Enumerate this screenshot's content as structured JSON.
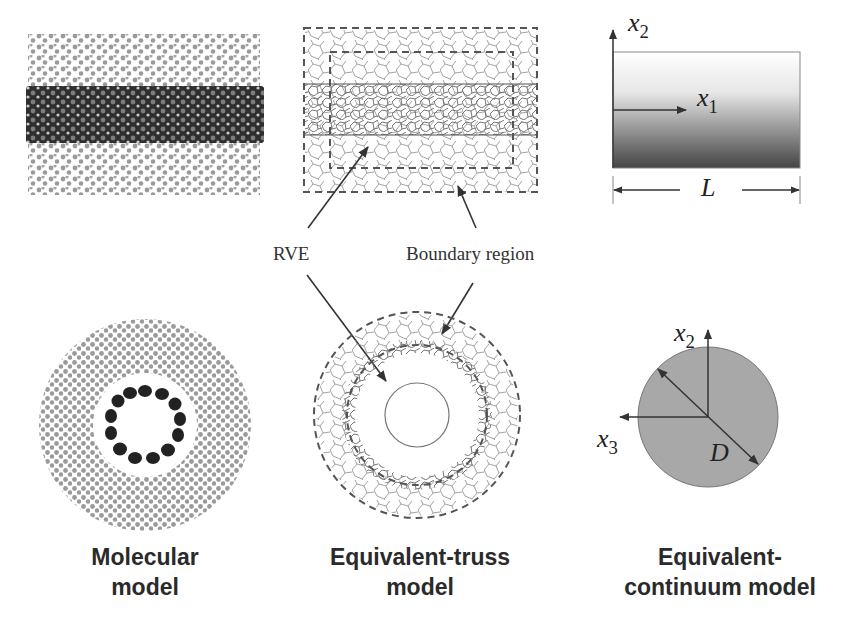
{
  "figure": {
    "panels": [
      {
        "id": "molecular",
        "caption_line1": "Molecular",
        "caption_line2": "model"
      },
      {
        "id": "truss",
        "caption_line1": "Equivalent-truss",
        "caption_line2": "model"
      },
      {
        "id": "continuum",
        "caption_line1": "Equivalent-",
        "caption_line2": "continuum model"
      }
    ],
    "annotations": {
      "rve": "RVE",
      "boundary": "Boundary region"
    },
    "axes": {
      "x1": "x",
      "x1_sub": "1",
      "x2": "x",
      "x2_sub": "2",
      "x2b": "x",
      "x2b_sub": "2",
      "x3": "x",
      "x3_sub": "3",
      "length": "L",
      "diameter": "D"
    },
    "colors": {
      "polymer_gray": "#9a9a9a",
      "nanotube_dark": "#2b2b2b",
      "line": "#555555",
      "disc_fill": "#a8a8a8"
    }
  }
}
